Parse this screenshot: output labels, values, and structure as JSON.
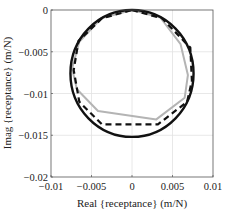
{
  "chart_data": {
    "type": "line",
    "title": "",
    "xlabel": "Real {receptance} (m/N)",
    "ylabel": "Imag {receptance} (m/N)",
    "xlim": [
      -0.01,
      0.01
    ],
    "ylim": [
      -0.02,
      0
    ],
    "grid": true,
    "legend": null,
    "xticks": [
      -0.01,
      -0.005,
      0,
      0.005,
      0.01
    ],
    "xtick_labels": [
      "−0.01",
      "−0.005",
      "0",
      "0.005",
      "0.01"
    ],
    "yticks": [
      0,
      -0.005,
      -0.01,
      -0.015,
      -0.02
    ],
    "ytick_labels": [
      "0",
      "−0.005",
      "−0.01",
      "−0.015",
      "−0.02"
    ],
    "series": [
      {
        "name": "analytical (circle)",
        "style": "solid",
        "color": "#111111",
        "width": 2.4,
        "circle": {
          "center": [
            0,
            -0.0076
          ],
          "radius": 0.0076
        },
        "x": [
          0,
          0.0038,
          0.0066,
          0.0076,
          0.0066,
          0.0038,
          0,
          -0.0038,
          -0.0066,
          -0.0076,
          -0.0066,
          -0.0038,
          0
        ],
        "y": [
          0,
          -0.001,
          -0.0038,
          -0.0076,
          -0.0114,
          -0.0142,
          -0.0152,
          -0.0142,
          -0.0114,
          -0.0076,
          -0.0038,
          -0.001,
          0
        ]
      },
      {
        "name": "gray measured",
        "style": "solid",
        "color": "#b4b4b4",
        "width": 2.0,
        "x": [
          0,
          0.0035,
          0.006,
          0.0069,
          0.0065,
          0.003,
          -0.0042,
          -0.0068,
          -0.0074,
          -0.0065,
          -0.0038,
          0
        ],
        "y": [
          0,
          -0.0009,
          -0.0041,
          -0.0078,
          -0.0105,
          -0.0131,
          -0.0121,
          -0.0095,
          -0.007,
          -0.0038,
          -0.001,
          0
        ]
      },
      {
        "name": "dashed estimated",
        "style": "dashed",
        "color": "#111111",
        "width": 2.2,
        "x": [
          0,
          0.0037,
          0.0064,
          0.0072,
          0.0074,
          0.0068,
          0.0032,
          -0.0037,
          -0.0065,
          -0.0072,
          -0.0066,
          -0.0037,
          0
        ],
        "y": [
          0,
          -0.001,
          -0.0037,
          -0.0045,
          -0.0085,
          -0.011,
          -0.0137,
          -0.0137,
          -0.011,
          -0.0072,
          -0.0037,
          -0.001,
          0
        ]
      }
    ]
  },
  "layout": {
    "plot_area": {
      "left": 51,
      "top": 10,
      "right": 213,
      "bottom": 177
    },
    "colors": {
      "axis": "#555555",
      "grid": "#e2e2e2",
      "background": "#ffffff"
    }
  }
}
